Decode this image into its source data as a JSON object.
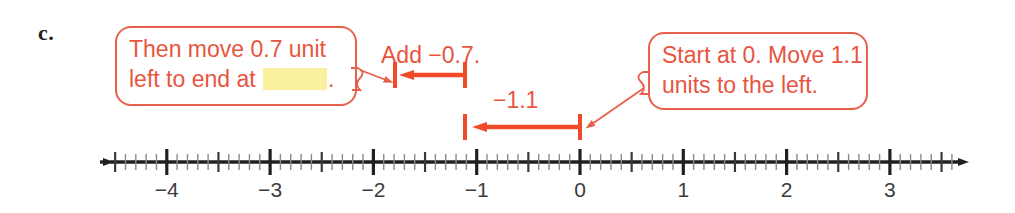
{
  "problem": {
    "label": "c."
  },
  "callouts": [
    {
      "id": "left",
      "line1": "Then move 0.7 unit",
      "line2_before": "left to end at",
      "line2_after": ".",
      "blank": "",
      "border_color": "#e8604c",
      "text_color": "#e8553f"
    },
    {
      "id": "right",
      "line1": "Start at 0. Move 1.1",
      "line2": "units to the left.",
      "border_color": "#e8604c",
      "text_color": "#e8553f"
    }
  ],
  "annotations": {
    "add_label": "Add −0.7.",
    "jump_label": "−1.1",
    "accent_color": "#f04a2a"
  },
  "chart_data": {
    "type": "number-line",
    "title": "",
    "xlabel": "",
    "ylabel": "",
    "xlim": [
      -4.6,
      3.55
    ],
    "tick_labels": [
      "−4",
      "−3",
      "−2",
      "−1",
      "0",
      "1",
      "2",
      "3"
    ],
    "tick_values": [
      -4,
      -3,
      -2,
      -1,
      0,
      1,
      2,
      3
    ],
    "minor_tick_step": 0.1,
    "half_ticks": true,
    "arrows_both_ends": true,
    "jumps": [
      {
        "name": "first-jump",
        "label": "−1.1",
        "from": 0,
        "to": -1.1,
        "direction": "left",
        "row": "lower"
      },
      {
        "name": "second-jump",
        "label": "Add −0.7.",
        "from": -1.1,
        "to": -1.8,
        "direction": "left",
        "row": "upper"
      }
    ]
  },
  "axis": {
    "labels": [
      {
        "text": "−4",
        "value": -4
      },
      {
        "text": "−3",
        "value": -3
      },
      {
        "text": "−2",
        "value": -2
      },
      {
        "text": "−1",
        "value": -1
      },
      {
        "text": "0",
        "value": 0
      },
      {
        "text": "1",
        "value": 1
      },
      {
        "text": "2",
        "value": 2
      },
      {
        "text": "3",
        "value": 3
      }
    ]
  }
}
